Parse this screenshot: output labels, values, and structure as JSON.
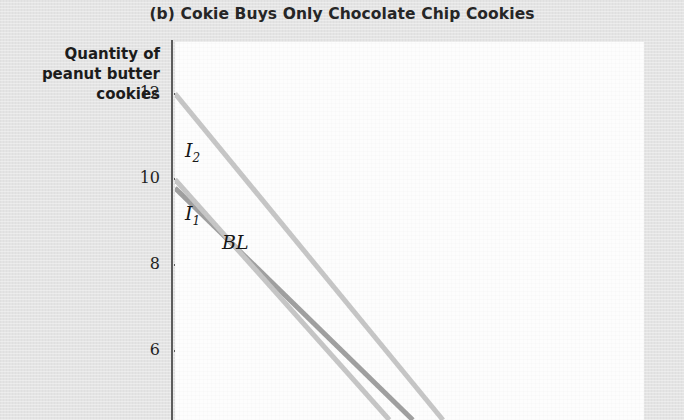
{
  "figure": {
    "panel_title": "(b) Cokie Buys Only Chocolate Chip Cookies",
    "y_axis_label_lines": [
      "Quantity of",
      "peanut butter",
      "cookies"
    ]
  },
  "chart_data": {
    "type": "line",
    "title": "(b) Cokie Buys Only Chocolate Chip Cookies",
    "xlabel": "",
    "ylabel": "Quantity of peanut butter cookies",
    "grid": false,
    "legend": "inline-labels",
    "y_ticks": [
      12,
      10,
      8,
      6
    ],
    "y_tick_labels": [
      "12",
      "10",
      "8",
      "6"
    ],
    "ylim": [
      4.4,
      13.2
    ],
    "xlim": [
      0,
      14
    ],
    "note": "Cropped figure: only the upper-left portion of the plot is visible; lines run off the bottom edge.",
    "series": [
      {
        "name": "I2",
        "label": "I₂",
        "label_text": "I",
        "label_subscript": "2",
        "color": "#c6c6c6",
        "role": "indifference-curve-higher",
        "points": [
          [
            0,
            12
          ],
          [
            8.0,
            4.4
          ]
        ]
      },
      {
        "name": "BL",
        "label": "BL",
        "label_text": "BL",
        "label_subscript": "",
        "color": "#a0a0a0",
        "role": "budget-line",
        "points": [
          [
            0,
            9.8
          ],
          [
            7.1,
            4.4
          ]
        ]
      },
      {
        "name": "I1",
        "label": "I₁",
        "label_text": "I",
        "label_subscript": "1",
        "color": "#c6c6c6",
        "role": "indifference-curve-lower",
        "points": [
          [
            0,
            10
          ],
          [
            6.4,
            4.4
          ]
        ]
      }
    ],
    "annotations": [
      {
        "name": "I2",
        "text": "I",
        "subscript": "2",
        "x_px": 185,
        "y_px": 139
      },
      {
        "name": "I1",
        "text": "I",
        "subscript": "1",
        "x_px": 185,
        "y_px": 202
      },
      {
        "name": "BL",
        "text": "BL",
        "subscript": "",
        "x_px": 222,
        "y_px": 231
      }
    ]
  },
  "colors": {
    "page_background": "#e4e4e4",
    "plot_background": "#fdfdfd",
    "axis": "#5c5c5c",
    "text": "#1c1c1c",
    "curve_light": "#c6c6c6",
    "curve_dark": "#a0a0a0"
  }
}
